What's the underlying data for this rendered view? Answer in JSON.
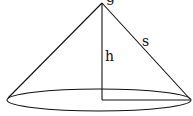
{
  "diagram": {
    "labels": {
      "apex": "g",
      "height": "h",
      "slant": "s"
    },
    "colors": {
      "line": "#111111",
      "background": "#ffffff"
    }
  }
}
